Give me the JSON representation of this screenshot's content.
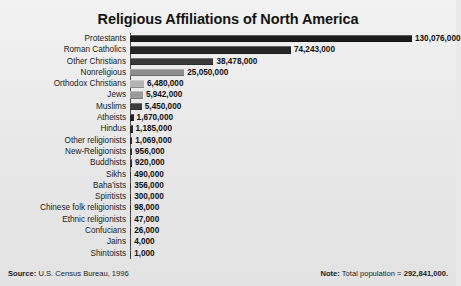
{
  "chart_data": {
    "type": "bar",
    "orientation": "horizontal",
    "title": "Religious Affiliations of North America",
    "xlabel": "",
    "ylabel": "",
    "grid": false,
    "legend": null,
    "xlim": [
      0,
      130076000
    ],
    "categories": [
      "Protestants",
      "Roman Catholics",
      "Other Christians",
      "Nonreligious",
      "Orthodox Christians",
      "Jews",
      "Muslims",
      "Atheists",
      "Hindus",
      "Other religionists",
      "New-Religionists",
      "Buddhists",
      "Sikhs",
      "Baha'ists",
      "Spiritists",
      "Chinese folk religionists",
      "Ethnic religionists",
      "Confucians",
      "Jains",
      "Shintoists"
    ],
    "values": [
      130076000,
      74243000,
      38478000,
      25050000,
      6480000,
      5942000,
      5450000,
      1670000,
      1185000,
      1069000,
      956000,
      920000,
      490000,
      356000,
      300000,
      98000,
      47000,
      26000,
      4000,
      1000
    ],
    "value_labels": [
      "130,076,000",
      "74,243,000",
      "38,478,000",
      "25,050,000",
      "6,480,000",
      "5,942,000",
      "5,450,000",
      "1,670,000",
      "1,185,000",
      "1,069,000",
      "956,000",
      "920,000",
      "490,000",
      "356,000",
      "300,000",
      "98,000",
      "47,000",
      "26,000",
      "4,000",
      "1,000"
    ],
    "bar_colors": [
      "#1c1c1c",
      "#262626",
      "#3a3a3a",
      "#8e8e8e",
      "#b4b4b4",
      "#9b9b9b",
      "#3c3c3c",
      "#232323",
      "#2a2a2a",
      "#2a2a2a",
      "#2e2e2e",
      "#2e2e2e",
      "#303030",
      "#303030",
      "#333333",
      "#333333",
      "#363636",
      "#363636",
      "#383838",
      "#383838"
    ],
    "annotations": {
      "source": "U.S. Census Bureau, 1996",
      "note": "Total population = 292,841,000."
    }
  },
  "footer": {
    "source_label": "Source:",
    "source_text": "U.S. Census Bureau, 1996",
    "note_label": "Note:",
    "note_text_prefix": "Total population = ",
    "note_value": "292,841,000."
  },
  "theme": {
    "background": "#e9e9e9",
    "text": "#1a1a1a",
    "axis": "#4a4a4a"
  }
}
